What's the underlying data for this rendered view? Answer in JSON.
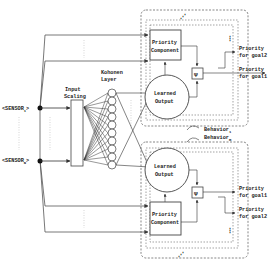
{
  "diagram": {
    "inputs": [
      {
        "label": "<SENSOR",
        "subscript": "1",
        "suffix": ">"
      },
      {
        "label": "<SENSOR",
        "subscript": "N",
        "suffix": ">"
      }
    ],
    "input_scaling": {
      "line1": "Input",
      "line2": "Scaling"
    },
    "kohonen": {
      "line1": "Kohonen",
      "line2": "Layer",
      "neuron_count": 10
    },
    "behaviors": [
      {
        "name_prefix": "Behavior",
        "name_subscript": "1",
        "priority_component": {
          "line1": "Priority",
          "line2": "Component"
        },
        "learned_output": {
          "line1": "Learned",
          "line2": "Output"
        },
        "combiner_symbol": "Ψ",
        "outputs": [
          {
            "line1": "Priority",
            "line2": "for goal2"
          },
          {
            "line1": "Priority",
            "line2": "for goal1"
          }
        ],
        "ellipsis": "⋮"
      },
      {
        "name_prefix": "Behavior",
        "name_subscript": "m",
        "priority_component": {
          "line1": "Priority",
          "line2": "Component"
        },
        "learned_output": {
          "line1": "Learned",
          "line2": "Output"
        },
        "combiner_symbol": "Ψ",
        "outputs": [
          {
            "line1": "Priority",
            "line2": "for goal1"
          },
          {
            "line1": "Priority",
            "line2": "for goal2"
          }
        ],
        "ellipsis": "⋮"
      }
    ],
    "stack_ellipsis": "⋰"
  },
  "colors": {
    "line": "#444444",
    "dashed": "#666666",
    "background": "#ffffff"
  }
}
